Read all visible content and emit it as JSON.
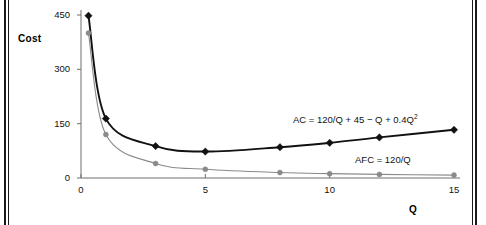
{
  "figure": {
    "background_color": "#ffffff",
    "border_color": "#1a1a1a"
  },
  "chart_data": {
    "type": "line",
    "title": "",
    "subtitle": "",
    "xlabel": "Q",
    "ylabel": "Cost",
    "xlim": [
      0,
      15.4
    ],
    "ylim": [
      0,
      470
    ],
    "xticks": [
      0,
      5,
      10,
      15
    ],
    "xticklabels": [
      "0",
      "5",
      "10",
      "15"
    ],
    "yticks": [
      0,
      150,
      300,
      450
    ],
    "yticklabels": [
      "0",
      "150",
      "300",
      "450"
    ],
    "grid": false,
    "legend": "inline-annotations",
    "x": [
      0.3,
      1,
      3,
      5,
      8,
      10,
      12,
      15
    ],
    "series": [
      {
        "name": "AC",
        "label": "AC = 120/Q + 45 − Q + 0.4Q",
        "label_superscript": "2",
        "formula": "AC = 120/Q + 45 - Q + 0.4Q^2",
        "color": "#111111",
        "marker": "diamond",
        "values": [
          448,
          164,
          88,
          73,
          85,
          97,
          112,
          133
        ]
      },
      {
        "name": "AFC",
        "label": "AFC = 120/Q",
        "formula": "AFC = 120/Q",
        "color": "#8a8a8a",
        "marker": "circle",
        "values": [
          400,
          120,
          40,
          24,
          15,
          12,
          10,
          8
        ]
      }
    ],
    "annotations": [
      {
        "text": "AC = 120/Q + 45 − Q + 0.4Q²",
        "x": 9.0,
        "y": 180
      },
      {
        "text": "AFC = 120/Q",
        "x": 11.5,
        "y": 66
      }
    ]
  }
}
